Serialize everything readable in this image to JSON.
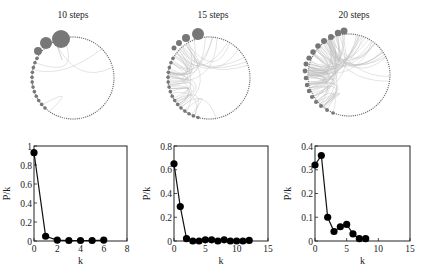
{
  "figure": {
    "panels": [
      {
        "title": "10 steps"
      },
      {
        "title": "15 steps"
      },
      {
        "title": "20 steps"
      }
    ]
  },
  "chart_data": [
    {
      "type": "line",
      "title": "10 steps",
      "xlabel": "k",
      "ylabel": "P/k",
      "xlim": [
        0,
        8
      ],
      "ylim": [
        0,
        1
      ],
      "xticks": [
        "0",
        "2",
        "4",
        "6",
        "8"
      ],
      "yticks": [
        "0",
        "0.2",
        "0.4",
        "0.6",
        "0.8",
        "1"
      ],
      "grid": false,
      "markers": "filled circles",
      "x": [
        0,
        1,
        2,
        3,
        4,
        5,
        6
      ],
      "y": [
        0.93,
        0.05,
        0.01,
        0.005,
        0.005,
        0.005,
        0.01
      ]
    },
    {
      "type": "line",
      "title": "15 steps",
      "xlabel": "k",
      "ylabel": "P/k",
      "xlim": [
        0,
        15
      ],
      "ylim": [
        0,
        0.8
      ],
      "xticks": [
        "0",
        "5",
        "10",
        "15"
      ],
      "yticks": [
        "0",
        "0.2",
        "0.4",
        "0.6",
        "0.8"
      ],
      "grid": false,
      "markers": "filled circles",
      "x": [
        0,
        1,
        2,
        3,
        4,
        5,
        6,
        7,
        8,
        9,
        10,
        11,
        12
      ],
      "y": [
        0.65,
        0.29,
        0.02,
        0.0,
        0.0,
        0.01,
        0.01,
        0.0,
        0.01,
        0.0,
        0.0,
        0.0,
        0.005
      ]
    },
    {
      "type": "line",
      "title": "20 steps",
      "xlabel": "k",
      "ylabel": "P/k",
      "xlim": [
        0,
        15
      ],
      "ylim": [
        0,
        0.4
      ],
      "xticks": [
        "0",
        "5",
        "10",
        "15"
      ],
      "yticks": [
        "0",
        "0.1",
        "0.2",
        "0.3",
        "0.4"
      ],
      "grid": false,
      "markers": "filled circles",
      "x": [
        0,
        1,
        2,
        3,
        4,
        5,
        6,
        7,
        8
      ],
      "y": [
        0.32,
        0.36,
        0.1,
        0.04,
        0.06,
        0.07,
        0.03,
        0.01,
        0.01
      ]
    }
  ]
}
